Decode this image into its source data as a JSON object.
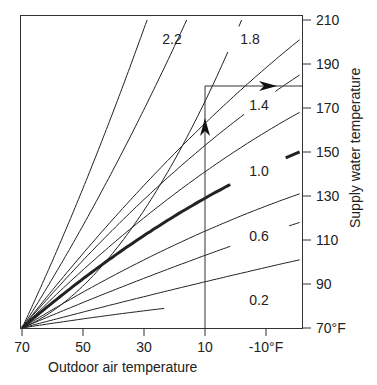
{
  "chart_data": {
    "type": "line",
    "title": "",
    "xlabel": "Outdoor air temperature",
    "ylabel": "Supply water temperature",
    "x_ticks": [
      "70",
      "50",
      "30",
      "10",
      "-10°F"
    ],
    "x_tick_values": [
      70,
      50,
      30,
      10,
      -10
    ],
    "y_ticks": [
      "70°F",
      "90",
      "110",
      "130",
      "150",
      "170",
      "190",
      "210"
    ],
    "y_tick_values": [
      70,
      90,
      110,
      130,
      150,
      170,
      190,
      210
    ],
    "xlim": [
      70,
      -21
    ],
    "ylim": [
      70,
      210
    ],
    "x_reversed": true,
    "grid": false,
    "legend": "none (curves labeled inline)",
    "series": [
      {
        "name": "0.2",
        "label": "0.2",
        "x": [
          70,
          10,
          -21
        ],
        "values": [
          70,
          81,
          85
        ]
      },
      {
        "name": "0.4",
        "x": [
          70,
          10,
          -21
        ],
        "values": [
          70,
          91,
          101
        ]
      },
      {
        "name": "0.6",
        "label": "0.6",
        "x": [
          70,
          10,
          -21
        ],
        "values": [
          70,
          103,
          118
        ]
      },
      {
        "name": "0.8",
        "x": [
          70,
          10,
          -21
        ],
        "values": [
          70,
          114,
          131
        ]
      },
      {
        "name": "1.0",
        "label": "1.0",
        "x": [
          70,
          10,
          -21
        ],
        "values": [
          70,
          129,
          150
        ],
        "emphasized": true
      },
      {
        "name": "1.2",
        "x": [
          70,
          10,
          -21
        ],
        "values": [
          70,
          141,
          168
        ]
      },
      {
        "name": "1.4",
        "label": "1.4",
        "x": [
          70,
          10,
          -21
        ],
        "values": [
          70,
          153,
          185
        ]
      },
      {
        "name": "1.6",
        "x": [
          70,
          10,
          -21
        ],
        "values": [
          70,
          163,
          201
        ]
      },
      {
        "name": "1.8",
        "label": "1.8",
        "x": [
          70,
          10,
          -2
        ],
        "values": [
          70,
          173,
          210
        ]
      },
      {
        "name": "2.0",
        "x": [
          70,
          28,
          16
        ],
        "values": [
          70,
          175,
          210
        ]
      },
      {
        "name": "2.2",
        "label": "2.2",
        "x": [
          70,
          38,
          29
        ],
        "values": [
          70,
          176,
          210
        ]
      }
    ],
    "annotations": [
      {
        "type": "vertical-line",
        "x": 10,
        "from_y": 70,
        "to_y": 180,
        "arrow": "up"
      },
      {
        "type": "horizontal-line",
        "y": 180,
        "from_x": 10,
        "to_x": -21,
        "arrow": "right"
      }
    ]
  },
  "labels": {
    "curve_labels": [
      "2.2",
      "1.8",
      "1.4",
      "1.0",
      "0.6",
      "0.2"
    ],
    "x_axis_title": "Outdoor air temperature",
    "y_axis_title": "Supply water temperature"
  }
}
